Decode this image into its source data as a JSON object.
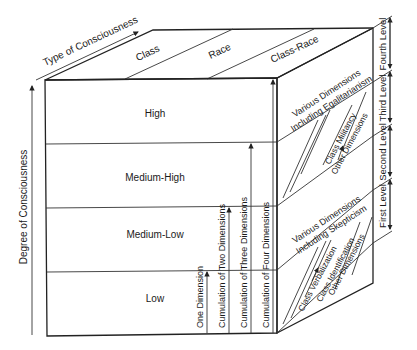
{
  "axes": {
    "type_axis_label": "Type of Consciousness",
    "degree_axis_label": "Degree of Consciousness"
  },
  "top_face": {
    "columns": [
      "Class",
      "Race",
      "Class-Race"
    ]
  },
  "front_face": {
    "rows": [
      "High",
      "Medium-High",
      "Medium-Low",
      "Low"
    ],
    "cumulation_arrows": [
      "One Dimension",
      "Cumulation of  Two Dimensions",
      "Cumulation of  Three Dimensions",
      "Cumulation of  Four Dimensions"
    ]
  },
  "right_face": {
    "fourth_region": [
      "Various Dimensions",
      "Including Egalitarianism"
    ],
    "third_region": [
      "Class Militancy",
      "Other Dimensions"
    ],
    "second_region": [
      "Various Dimensions",
      "Including Skepticism"
    ],
    "first_region": [
      "Class Verbalization",
      "Class Identification",
      "Other Dimensions"
    ]
  },
  "levels": [
    "Fourth Level",
    "Third Level",
    "Second Level",
    "First Level"
  ],
  "colors": {
    "line": "#222222",
    "text": "#1a1a1a",
    "background": "#ffffff"
  }
}
